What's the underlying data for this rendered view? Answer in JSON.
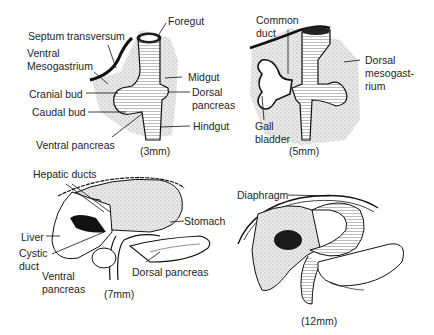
{
  "figure": {
    "panels": [
      {
        "stage": "(3mm)",
        "labels": {
          "foregut": "Foregut",
          "septum_transversum": "Septum transversum",
          "ventral_mesogastrium_1": "Ventral",
          "ventral_mesogastrium_2": "Mesogastrium",
          "midgut": "Midgut",
          "cranial_bud": "Cranial bud",
          "dorsal_pancreas_1": "Dorsal",
          "dorsal_pancreas_2": "pancreas",
          "caudal_bud": "Caudal bud",
          "hindgut": "Hindgut",
          "ventral_pancreas": "Ventral pancreas"
        }
      },
      {
        "stage": "(5mm)",
        "labels": {
          "common_duct_1": "Common",
          "common_duct_2": "duct",
          "dorsal_mesogastrium_1": "Dorsal",
          "dorsal_mesogastrium_2": "mesogast-",
          "dorsal_mesogastrium_3": "rium",
          "gall_bladder_1": "Gall",
          "gall_bladder_2": "bladder"
        }
      },
      {
        "stage": "(7mm)",
        "labels": {
          "hepatic_ducts": "Hepatic ducts",
          "stomach": "Stomach",
          "liver": "Liver",
          "cystic_duct_1": "Cystic",
          "cystic_duct_2": "duct",
          "ventral_pancreas_1": "Ventral",
          "ventral_pancreas_2": "pancreas",
          "dorsal_pancreas": "Dorsal pancreas"
        }
      },
      {
        "stage": "(12mm)",
        "labels": {
          "diaphragm": "Diaphragm"
        }
      }
    ],
    "colors": {
      "ink": "#1a1a1a",
      "stipple": "#bdbdbd",
      "background": "#ffffff"
    }
  }
}
